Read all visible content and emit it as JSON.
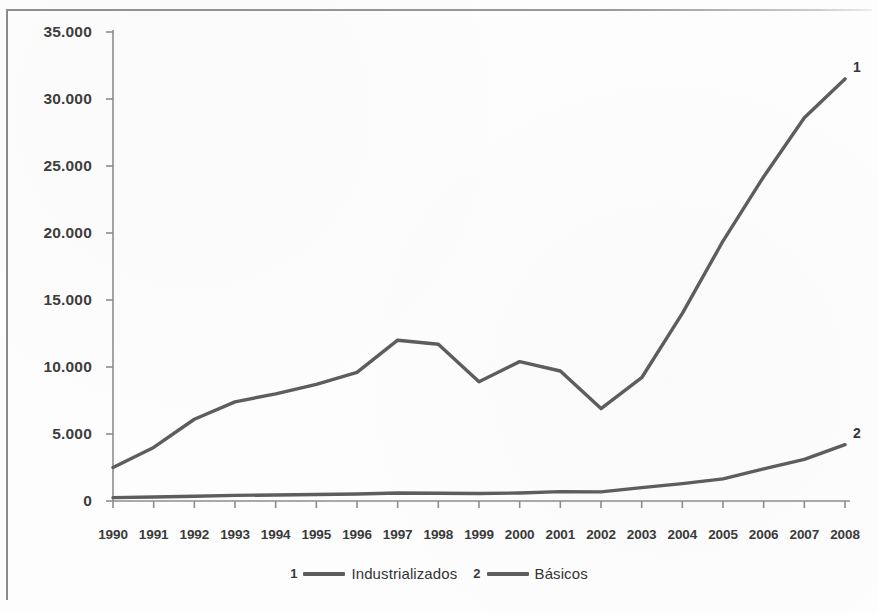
{
  "chart_data": {
    "type": "line",
    "title": "",
    "subtitle": "",
    "xlabel": "",
    "ylabel": "",
    "grid": false,
    "legend_position": "bottom-center",
    "categories": [
      "1990",
      "1991",
      "1992",
      "1993",
      "1994",
      "1995",
      "1996",
      "1997",
      "1998",
      "1999",
      "2000",
      "2001",
      "2002",
      "2003",
      "2004",
      "2005",
      "2006",
      "2007",
      "2008"
    ],
    "ylim": [
      0,
      35000
    ],
    "yticks": [
      0,
      5000,
      10000,
      15000,
      20000,
      25000,
      30000,
      35000
    ],
    "ytick_labels": [
      "0",
      "5.000",
      "10.000",
      "15.000",
      "20.000",
      "25.000",
      "30.000",
      "35.000"
    ],
    "series": [
      {
        "name": "Industrializados",
        "key": "1",
        "color": "#5d5d5d",
        "end_label": "1",
        "values": [
          2500,
          4000,
          6100,
          7400,
          8000,
          8700,
          9600,
          12000,
          11700,
          8900,
          10400,
          9700,
          6900,
          9200,
          14000,
          19400,
          24200,
          28600,
          31500
        ]
      },
      {
        "name": "Básicos",
        "key": "2",
        "color": "#5d5d5d",
        "end_label": "2",
        "values": [
          250,
          300,
          350,
          420,
          450,
          480,
          520,
          600,
          580,
          560,
          600,
          700,
          680,
          1000,
          1300,
          1650,
          2400,
          3100,
          4200
        ]
      }
    ]
  },
  "legend": {
    "entries": [
      {
        "key": "1",
        "label": "Industrializados"
      },
      {
        "key": "2",
        "label": "Básicos"
      }
    ]
  }
}
